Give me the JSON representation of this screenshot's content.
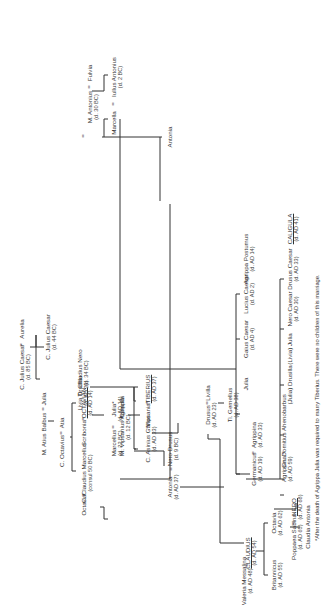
{
  "diagram": {
    "orientation": "rotated 90 degrees counter-clockwise",
    "people": {
      "aurelia": {
        "name": "Aurelia",
        "dates": ""
      },
      "c_julius_caesar_elder": {
        "name": "C. Julius Caesar",
        "dates": "(d. 85 BC)"
      },
      "c_julius_caesar": {
        "name": "C. Julius Caesar",
        "dates": "(d. 44 BC)"
      },
      "julia_sister": {
        "name": "Julia",
        "dates": ""
      },
      "m_atius_balbus": {
        "name": "M. Atius Balbus",
        "dates": ""
      },
      "atia": {
        "name": "Atia",
        "dates": ""
      },
      "c_octavius": {
        "name": "C. Octavius",
        "dates": ""
      },
      "octavian": {
        "name": "OCTAVIAN",
        "dates": "(d. AD 14)",
        "emperor": true
      },
      "scribonia": {
        "name": "Scribonia",
        "dates": ""
      },
      "c_claudius_marcellus": {
        "name": "C. Claudius Marcellus",
        "dates": "(consul 50 BC)"
      },
      "octavia": {
        "name": "Octavia",
        "dates": ""
      },
      "m_antonius": {
        "name": "M. Antonius",
        "dates": "(d. 30 BC)"
      },
      "fulvia": {
        "name": "Fulvia",
        "dates": ""
      },
      "julia_daughter": {
        "name": "Julia*",
        "dates": "(d. AD 14)"
      },
      "marcellus": {
        "name": "Marcellus",
        "dates": "(d. 22 BC)"
      },
      "marcella": {
        "name": "Marcella",
        "dates": ""
      },
      "iullus_antonius": {
        "name": "Iullus Antonius",
        "dates": "(d. 2 BC)"
      },
      "antonia": {
        "name": "Antonia",
        "dates": ""
      },
      "ti_claudius_nero": {
        "name": "Ti. Claudius Nero",
        "dates": "(d. 34 BC)"
      },
      "livia_drusilla": {
        "name": "Livia Drusilla",
        "dates": "(d. AD 29)"
      },
      "caecilia": {
        "name": "Caecilia",
        "dates": ""
      },
      "m_vipsanius_agrippa": {
        "name": "M. Vipsanius Agrippa",
        "dates": "(d. 12 BC)"
      },
      "tiberius": {
        "name": "TIBERIUS",
        "dates": "(d. AD 37)",
        "emperor": true
      },
      "vipsania": {
        "name": "Vipsania",
        "dates": ""
      },
      "c_asinius_gallus": {
        "name": "C. Asinius Gallus",
        "dates": "(d. AD 33)"
      },
      "nero_drusus": {
        "name": "Nero Drusus",
        "dates": "(d. 9 BC)"
      },
      "antonia_minor": {
        "name": "Antonia",
        "dates": "(d. AD 37)"
      },
      "livilla": {
        "name": "Livilla",
        "dates": ""
      },
      "drusus": {
        "name": "Drusus",
        "dates": "(d. AD 23)"
      },
      "ti_gemellus": {
        "name": "Ti. Gemellus",
        "dates": "(d. AD 38)"
      },
      "gaius_caesar": {
        "name": "Gaius Caesar",
        "dates": "(d. AD 4)"
      },
      "lucius_caesar": {
        "name": "Lucius Caesar",
        "dates": "(d. AD 2)"
      },
      "agrippa_postumus": {
        "name": "Agrippa Postumus",
        "dates": "(d. AD 14)"
      },
      "julia_granddaughter": {
        "name": "Julia",
        "dates": ""
      },
      "agrippina_elder": {
        "name": "Agrippina",
        "dates": "(d. AD 33)"
      },
      "germanicus": {
        "name": "Germanicus",
        "dates": "(d. AD 19)"
      },
      "nero_caesar": {
        "name": "Nero Caesar",
        "dates": "(d. AD 30)"
      },
      "drusus_caesar": {
        "name": "Drusus Caesar",
        "dates": "(d. AD 33)"
      },
      "caligula": {
        "name": "CALIGULA",
        "dates": "(d. AD 41)",
        "emperor": true
      },
      "julia_drusilla": {
        "name": "(Julia) Drusilla",
        "dates": ""
      },
      "livia_julia": {
        "name": "(Livia) Julia",
        "dates": ""
      },
      "agrippina_younger": {
        "name": "Agrippina",
        "dates": "(d. AD 59)"
      },
      "cn_domitius": {
        "name": "Cn. Domitius Ahenobarbus",
        "dates": ""
      },
      "claudius": {
        "name": "CLAUDIUS",
        "dates": "(d. AD 54)",
        "emperor": true
      },
      "valeria_messalina": {
        "name": "Valeria Messalina",
        "dates": "(d. AD 48)"
      },
      "britannicus": {
        "name": "Britannicus",
        "dates": "(d. AD 55)"
      },
      "octavia_daughter": {
        "name": "Octavia",
        "dates": "(d. AD 62)"
      },
      "nero": {
        "name": "NERO",
        "dates": "(d. AD 68)",
        "emperor": true
      },
      "poppaea_sabina": {
        "name": "Poppaea Sabina",
        "dates": "(d. AD 65)"
      },
      "claudia_antonia": {
        "name": "Claudia Antonia",
        "dates": ""
      }
    },
    "marriage_symbol": "=",
    "footnote": "*After the death of Agrippa Julia was required to marry Tiberius. There were no children of this marriage."
  }
}
